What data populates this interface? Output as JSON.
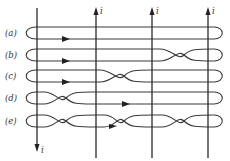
{
  "diagram": {
    "wires": [
      {
        "id": "wire-1",
        "x": 37,
        "direction": "down",
        "current_label": "i"
      },
      {
        "id": "wire-2",
        "x": 96,
        "direction": "up",
        "current_label": "i"
      },
      {
        "id": "wire-3",
        "x": 152,
        "direction": "up",
        "current_label": "i"
      },
      {
        "id": "wire-4",
        "x": 208,
        "direction": "up",
        "current_label": "i"
      }
    ],
    "loops": [
      {
        "label": "(a)",
        "y": 33,
        "crossings": [],
        "arrow_x": 65
      },
      {
        "label": "(b)",
        "y": 55,
        "crossings": [
          184
        ],
        "arrow_x": 65
      },
      {
        "label": "(c)",
        "y": 76,
        "crossings": [
          124
        ],
        "arrow_x": 65
      },
      {
        "label": "(d)",
        "y": 98,
        "crossings": [
          66
        ],
        "arrow_x": 125
      },
      {
        "label": "(e)",
        "y": 121,
        "crossings": [
          66,
          124,
          184
        ],
        "arrow_x": 112
      }
    ],
    "colors": {
      "line": "#2a2a2a",
      "background": "#ffffff",
      "text": "#333333"
    }
  }
}
